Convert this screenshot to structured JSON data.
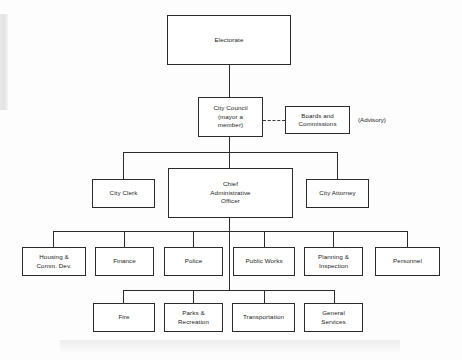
{
  "diagram": {
    "type": "organization-chart",
    "levels": [
      {
        "level": 1,
        "nodes": [
          {
            "id": "electorate",
            "label": "Electorate"
          }
        ]
      },
      {
        "level": 2,
        "nodes": [
          {
            "id": "city-council",
            "label": "City Council\n(mayor a\nmember)"
          },
          {
            "id": "boards-commissions",
            "label": "Boards and\nCommissions"
          }
        ]
      },
      {
        "level": 3,
        "nodes": [
          {
            "id": "city-clerk",
            "label": "City Clerk"
          },
          {
            "id": "chief-administrative-officer",
            "label": "Chief\nAdministrative\nOfficer"
          },
          {
            "id": "city-attorney",
            "label": "City Attorney"
          }
        ]
      },
      {
        "level": 4,
        "nodes": [
          {
            "id": "housing-comm-dev",
            "label": "Housing &\nComm. Dev."
          },
          {
            "id": "finance",
            "label": "Finance"
          },
          {
            "id": "police",
            "label": "Police"
          },
          {
            "id": "public-works",
            "label": "Public Works"
          },
          {
            "id": "planning-inspection",
            "label": "Planning &\nInspection"
          },
          {
            "id": "personnel",
            "label": "Personnel"
          }
        ]
      },
      {
        "level": 5,
        "nodes": [
          {
            "id": "fire",
            "label": "Fire"
          },
          {
            "id": "parks-recreation",
            "label": "Parks &\nRecreation"
          },
          {
            "id": "transportation",
            "label": "Transportation"
          },
          {
            "id": "general-services",
            "label": "General\nServices"
          }
        ]
      }
    ],
    "annotations": [
      {
        "id": "advisory-note",
        "label": "(Advisory)"
      }
    ],
    "relations": {
      "advisory_link": "dashed",
      "hierarchy_link": "solid"
    },
    "colors": {
      "line": "#2b2b2b",
      "box_fill": "#ffffff",
      "text": "#1a1a1a",
      "background": "#fdfdfd"
    }
  }
}
